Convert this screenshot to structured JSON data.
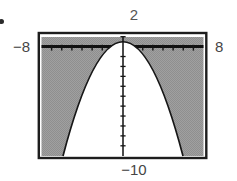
{
  "figure": {
    "bullet_marker": "•",
    "colors": {
      "shade_gray": "#9a9a9a",
      "frame_black": "#1d1d1d",
      "curve_black": "#161616",
      "label_text": "#454545",
      "background": "#ffffff"
    }
  },
  "chart_data": {
    "type": "area",
    "title": "",
    "window": {
      "xmin": -8,
      "xmax": 8,
      "ymin": -10,
      "ymax": 2
    },
    "window_labels": {
      "top": "2",
      "left": "−8",
      "right": "8",
      "bottom": "−10"
    },
    "x_axis": {
      "ticks_shown": true,
      "tick_interval": 1
    },
    "y_axis": {
      "ticks_shown": true,
      "tick_interval": 1
    },
    "series": [
      {
        "name": "parabola-boundary",
        "approx_equation": "y ≈ 1 − x²/3",
        "x": [
          -5.74,
          -5,
          -4,
          -3,
          -2,
          -1,
          0,
          1,
          2,
          3,
          4,
          5,
          5.74
        ],
        "y": [
          -10,
          -7.33,
          -4.33,
          -2,
          -0.33,
          0.67,
          1,
          0.67,
          -0.33,
          -2,
          -4.33,
          -7.33,
          -10
        ]
      }
    ],
    "shading": {
      "shaded_region": "region above/outside the parabola (y greater than the curve)",
      "shaded_color": "#9a9a9a",
      "unshaded_region": "region below/inside the parabola",
      "unshaded_color": "#ffffff"
    },
    "legend": false,
    "grid": false
  }
}
